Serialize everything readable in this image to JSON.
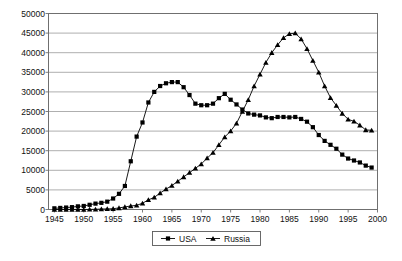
{
  "chart_data": {
    "type": "line",
    "title": "",
    "subtitle": "",
    "xlabel": "",
    "ylabel": "",
    "xlim": [
      1944,
      2000
    ],
    "ylim": [
      0,
      50000
    ],
    "grid": true,
    "legend_position": "bottom",
    "y_ticks": [
      0,
      5000,
      10000,
      15000,
      20000,
      25000,
      30000,
      35000,
      40000,
      45000,
      50000
    ],
    "y_tick_labels": [
      "0",
      "5000",
      "10000",
      "15000",
      "20000",
      "25000",
      "30000",
      "35000",
      "40000",
      "45000",
      "50000"
    ],
    "x_ticks": [
      1945,
      1950,
      1955,
      1960,
      1965,
      1970,
      1975,
      1980,
      1985,
      1990,
      1995,
      2000
    ],
    "x_tick_labels": [
      "1945",
      "1950",
      "1955",
      "1960",
      "1965",
      "1970",
      "1975",
      "1980",
      "1985",
      "1990",
      "1995",
      "2000"
    ],
    "x": [
      1945,
      1946,
      1947,
      1948,
      1949,
      1950,
      1951,
      1952,
      1953,
      1954,
      1955,
      1956,
      1957,
      1958,
      1959,
      1960,
      1961,
      1962,
      1963,
      1964,
      1965,
      1966,
      1967,
      1968,
      1969,
      1970,
      1971,
      1972,
      1973,
      1974,
      1975,
      1976,
      1977,
      1978,
      1979,
      1980,
      1981,
      1982,
      1983,
      1984,
      1985,
      1986,
      1987,
      1988,
      1989,
      1990,
      1991,
      1992,
      1993,
      1994,
      1995,
      1996,
      1997,
      1998,
      1999
    ],
    "series": [
      {
        "name": "USA",
        "marker": "square",
        "color": "#000000",
        "values": [
          300,
          400,
          500,
          600,
          800,
          900,
          1200,
          1500,
          1700,
          2000,
          2800,
          4000,
          6000,
          12300,
          18600,
          22200,
          27300,
          30000,
          31500,
          32200,
          32500,
          32500,
          31200,
          29200,
          27000,
          26600,
          26600,
          27000,
          28400,
          29500,
          28000,
          26800,
          25500,
          24500,
          24200,
          24000,
          23500,
          23300,
          23600,
          23600,
          23500,
          23600,
          23100,
          22400,
          21000,
          19000,
          17500,
          16500,
          15500,
          14000,
          13000,
          12500,
          12000,
          11200,
          10700
        ]
      },
      {
        "name": "Russia",
        "marker": "triangle",
        "color": "#000000",
        "values": [
          0,
          0,
          0,
          0,
          1,
          5,
          25,
          50,
          120,
          150,
          200,
          400,
          650,
          900,
          1060,
          1600,
          2450,
          3100,
          4200,
          5200,
          6100,
          7200,
          8300,
          9400,
          10500,
          11600,
          13100,
          14500,
          16500,
          18500,
          20000,
          22000,
          25000,
          28000,
          31500,
          34500,
          37500,
          40000,
          42000,
          43800,
          44800,
          45000,
          43500,
          41000,
          38000,
          35000,
          31500,
          28500,
          26500,
          24500,
          23000,
          22500,
          21500,
          20300,
          20200
        ]
      }
    ]
  },
  "legend": {
    "entries": [
      {
        "label": "USA",
        "marker": "square"
      },
      {
        "label": "Russia",
        "marker": "triangle"
      }
    ]
  },
  "colors": {
    "gridline": "#9a9a9a",
    "frame": "#6f6f6f",
    "series": "#000000",
    "text": "#111111",
    "background": "#ffffff"
  }
}
